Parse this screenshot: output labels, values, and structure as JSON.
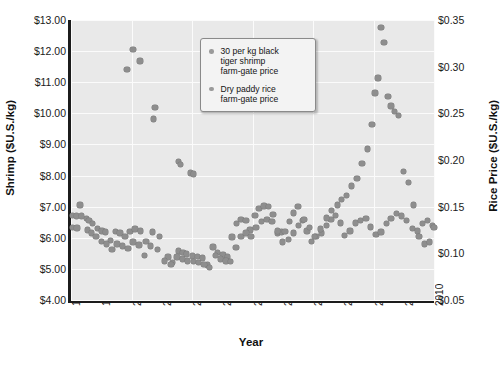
{
  "chart_data": {
    "type": "scatter",
    "title": "",
    "xlabel": "Year",
    "ylabel": "Shrimp ($U.S./kg)",
    "ylabel_right": "Rice Price ($U.S./kg)",
    "xlim": [
      1998,
      2010
    ],
    "ylim": [
      4.0,
      13.0
    ],
    "ylim_right": [
      0.05,
      0.35
    ],
    "grid": true,
    "legend_position": "top-center-right",
    "xticks": [
      "1998",
      "1999",
      "2000",
      "2001",
      "2002",
      "2003",
      "2004",
      "2005",
      "2006",
      "2007",
      "2008",
      "2009",
      "2010"
    ],
    "yticks_left": [
      "$4.00",
      "$5.00",
      "$6.00",
      "$7.00",
      "$8.00",
      "$9.00",
      "$10.00",
      "$11.00",
      "$12.00",
      "$13.00"
    ],
    "yticks_right": [
      "$0.05",
      "$0.10",
      "$0.15",
      "$0.20",
      "$0.25",
      "$0.30",
      "$0.35"
    ],
    "marker_color": "#8e8e8e",
    "plot_background": "#e9e9e9",
    "gridline_color": "#fbfbfb",
    "series": [
      {
        "name": "30 per kg black tiger shrimp farm-gate price",
        "axis": "left",
        "units": "$U.S./kg",
        "points": [
          [
            1998.05,
            6.72
          ],
          [
            1998.18,
            6.7
          ],
          [
            1998.3,
            7.05
          ],
          [
            1998.52,
            6.62
          ],
          [
            1998.6,
            6.55
          ],
          [
            1998.72,
            6.45
          ],
          [
            1998.88,
            6.3
          ],
          [
            1999.02,
            6.22
          ],
          [
            1999.15,
            6.18
          ],
          [
            1999.3,
            5.92
          ],
          [
            1999.48,
            6.2
          ],
          [
            1999.62,
            6.16
          ],
          [
            1999.78,
            6.05
          ],
          [
            1999.95,
            6.2
          ],
          [
            2000.12,
            6.28
          ],
          [
            2000.3,
            6.22
          ],
          [
            2000.48,
            5.88
          ],
          [
            2000.7,
            6.18
          ],
          [
            2000.92,
            6.05
          ],
          [
            2001.2,
            5.38
          ],
          [
            2001.35,
            5.2
          ],
          [
            2001.55,
            5.58
          ],
          [
            2001.7,
            5.52
          ],
          [
            2001.82,
            5.48
          ],
          [
            2002.02,
            5.42
          ],
          [
            2002.18,
            5.4
          ],
          [
            2002.35,
            5.35
          ],
          [
            2002.52,
            5.12
          ],
          [
            2002.7,
            5.7
          ],
          [
            2002.85,
            5.52
          ],
          [
            2003.02,
            5.45
          ],
          [
            2003.18,
            5.38
          ],
          [
            2003.32,
            6.02
          ],
          [
            2003.48,
            6.45
          ],
          [
            2003.62,
            6.58
          ],
          [
            2003.78,
            6.55
          ],
          [
            2003.92,
            6.25
          ],
          [
            2004.08,
            6.72
          ],
          [
            2004.22,
            6.95
          ],
          [
            2004.38,
            7.02
          ],
          [
            2004.52,
            7.0
          ],
          [
            2004.68,
            6.75
          ],
          [
            2004.82,
            6.15
          ],
          [
            2004.95,
            6.18
          ],
          [
            2005.08,
            6.2
          ],
          [
            2005.22,
            6.52
          ],
          [
            2005.35,
            6.8
          ],
          [
            2005.5,
            7.0
          ],
          [
            2005.65,
            6.55
          ],
          [
            2005.8,
            6.22
          ],
          [
            2005.95,
            5.88
          ],
          [
            2006.1,
            6.05
          ],
          [
            2006.28,
            6.15
          ],
          [
            2006.45,
            6.4
          ],
          [
            2006.6,
            6.58
          ],
          [
            2006.75,
            6.72
          ],
          [
            2006.9,
            6.48
          ],
          [
            2007.05,
            6.08
          ],
          [
            2007.22,
            6.22
          ],
          [
            2007.4,
            6.48
          ],
          [
            2007.58,
            6.55
          ],
          [
            2007.75,
            6.62
          ],
          [
            2007.9,
            6.35
          ],
          [
            2008.08,
            6.1
          ],
          [
            2008.25,
            6.18
          ],
          [
            2008.42,
            6.45
          ],
          [
            2008.58,
            6.62
          ],
          [
            2008.75,
            6.78
          ],
          [
            2008.92,
            6.7
          ],
          [
            2009.1,
            6.55
          ],
          [
            2009.28,
            6.3
          ],
          [
            2009.45,
            6.22
          ],
          [
            2009.62,
            6.45
          ],
          [
            2009.78,
            6.55
          ],
          [
            2009.95,
            6.4
          ],
          [
            1999.85,
            11.4
          ],
          [
            2000.05,
            12.05
          ],
          [
            2000.28,
            11.68
          ],
          [
            2000.72,
            9.82
          ],
          [
            2000.78,
            10.18
          ],
          [
            2001.55,
            8.45
          ],
          [
            2001.62,
            8.35
          ],
          [
            2001.95,
            8.08
          ],
          [
            2002.05,
            8.05
          ]
        ]
      },
      {
        "name": "Dry paddy rice farm-gate price",
        "axis": "right",
        "units": "$U.S./kg",
        "points": [
          [
            1998.05,
            0.128
          ],
          [
            1998.2,
            0.127
          ],
          [
            1998.35,
            0.14
          ],
          [
            1998.55,
            0.125
          ],
          [
            1998.68,
            0.122
          ],
          [
            1998.82,
            0.118
          ],
          [
            1999.0,
            0.113
          ],
          [
            1999.18,
            0.11
          ],
          [
            1999.35,
            0.104
          ],
          [
            1999.52,
            0.11
          ],
          [
            1999.7,
            0.108
          ],
          [
            1999.88,
            0.105
          ],
          [
            2000.05,
            0.112
          ],
          [
            2000.25,
            0.109
          ],
          [
            2000.42,
            0.098
          ],
          [
            2000.62,
            0.108
          ],
          [
            2000.85,
            0.104
          ],
          [
            2001.1,
            0.092
          ],
          [
            2001.3,
            0.088
          ],
          [
            2001.5,
            0.096
          ],
          [
            2001.68,
            0.094
          ],
          [
            2001.85,
            0.092
          ],
          [
            2002.05,
            0.091
          ],
          [
            2002.22,
            0.09
          ],
          [
            2002.4,
            0.088
          ],
          [
            2002.58,
            0.085
          ],
          [
            2002.78,
            0.098
          ],
          [
            2002.95,
            0.094
          ],
          [
            2003.12,
            0.092
          ],
          [
            2003.28,
            0.091
          ],
          [
            2003.45,
            0.106
          ],
          [
            2003.62,
            0.118
          ],
          [
            2003.78,
            0.122
          ],
          [
            2003.95,
            0.118
          ],
          [
            2004.12,
            0.128
          ],
          [
            2004.3,
            0.134
          ],
          [
            2004.48,
            0.136
          ],
          [
            2004.65,
            0.134
          ],
          [
            2004.82,
            0.124
          ],
          [
            2005.0,
            0.112
          ],
          [
            2005.18,
            0.115
          ],
          [
            2005.35,
            0.122
          ],
          [
            2005.52,
            0.13
          ],
          [
            2005.7,
            0.136
          ],
          [
            2005.88,
            0.128
          ],
          [
            2006.05,
            0.118
          ],
          [
            2006.25,
            0.126
          ],
          [
            2006.45,
            0.138
          ],
          [
            2006.62,
            0.146
          ],
          [
            2006.8,
            0.152
          ],
          [
            2006.95,
            0.158
          ],
          [
            2007.1,
            0.162
          ],
          [
            2007.28,
            0.172
          ],
          [
            2007.45,
            0.18
          ],
          [
            2007.62,
            0.196
          ],
          [
            2007.8,
            0.212
          ],
          [
            2007.95,
            0.238
          ],
          [
            2008.05,
            0.272
          ],
          [
            2008.15,
            0.288
          ],
          [
            2008.25,
            0.342
          ],
          [
            2008.35,
            0.326
          ],
          [
            2008.48,
            0.268
          ],
          [
            2008.58,
            0.258
          ],
          [
            2008.7,
            0.252
          ],
          [
            2008.82,
            0.248
          ],
          [
            2009.0,
            0.188
          ],
          [
            2009.15,
            0.176
          ],
          [
            2009.32,
            0.152
          ],
          [
            2009.5,
            0.118
          ],
          [
            2009.68,
            0.11
          ],
          [
            2009.85,
            0.112
          ],
          [
            2010.0,
            0.128
          ]
        ]
      }
    ]
  },
  "legend": {
    "items": [
      {
        "label": "30 per kg black\ntiger shrimp\nfarm-gate price"
      },
      {
        "label": "Dry paddy rice\nfarm-gate price"
      }
    ]
  },
  "axes": {
    "left_title": "Shrimp ($U.S./kg)",
    "right_title": "Rice Price ($U.S./kg)",
    "x_title": "Year"
  }
}
